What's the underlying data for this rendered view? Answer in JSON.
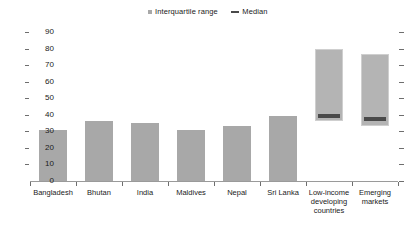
{
  "legend": {
    "items": [
      {
        "label": "Interquartile range",
        "marker": "square-swatch-icon",
        "color": "#a8a8a8"
      },
      {
        "label": "Median",
        "marker": "dash-line-icon",
        "color": "#4a4a4a"
      }
    ]
  },
  "axis": {
    "y_ticks": [
      "0",
      "10",
      "20",
      "30",
      "40",
      "50",
      "60",
      "70",
      "80",
      "90"
    ]
  },
  "chart_data": {
    "type": "bar",
    "title": "",
    "xlabel": "",
    "ylabel": "",
    "ylim": [
      0,
      90
    ],
    "ytick_step": 10,
    "grid": false,
    "legend_position": "top-center",
    "legend_entries": [
      "Interquartile range",
      "Median"
    ],
    "bar_color": "#a8a8a8",
    "median_color": "#4a4a4a",
    "categories": [
      "Bangladesh",
      "Bhutan",
      "India",
      "Maldives",
      "Nepal",
      "Sri Lanka",
      "Low-income developing countries",
      "Emerging markets"
    ],
    "series": [
      {
        "name": "Interquartile range",
        "points": [
          {
            "category": "Bangladesh",
            "low": 0,
            "high": 31,
            "median": null
          },
          {
            "category": "Bhutan",
            "low": 0,
            "high": 36,
            "median": null
          },
          {
            "category": "India",
            "low": 0,
            "high": 35,
            "median": null
          },
          {
            "category": "Maldives",
            "low": 0,
            "high": 31,
            "median": null
          },
          {
            "category": "Nepal",
            "low": 0,
            "high": 33,
            "median": null
          },
          {
            "category": "Sri Lanka",
            "low": 0,
            "high": 39,
            "median": null
          },
          {
            "category": "Low-income developing countries",
            "low": 36,
            "high": 80,
            "median": 40
          },
          {
            "category": "Emerging markets",
            "low": 33,
            "high": 77,
            "median": 38
          }
        ]
      }
    ],
    "values": [
      31,
      36,
      35,
      31,
      33,
      39,
      80,
      77
    ],
    "medians": [
      null,
      null,
      null,
      null,
      null,
      null,
      40,
      38
    ]
  }
}
